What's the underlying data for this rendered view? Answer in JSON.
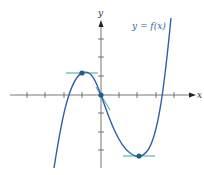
{
  "diagram": {
    "function_label": "y = f(x)",
    "x_axis_label": "x",
    "y_axis_label": "y",
    "colors": {
      "curve": "#2f5fa8",
      "axis": "#555555",
      "tangent": "#3aa88f",
      "point": "#1f5f8a",
      "label": "#2f5fa8"
    },
    "critical_points": [
      {
        "name": "local-maximum",
        "x": -1,
        "y": 1
      },
      {
        "name": "inflection-point",
        "x": 0,
        "y": 0
      },
      {
        "name": "local-minimum",
        "x": 2,
        "y": -3.3
      }
    ],
    "x_ticks": [
      -4,
      -3,
      -2,
      -1,
      1,
      2,
      3,
      4
    ],
    "y_ticks": [
      -3,
      -2,
      -1,
      1,
      2,
      3
    ]
  }
}
